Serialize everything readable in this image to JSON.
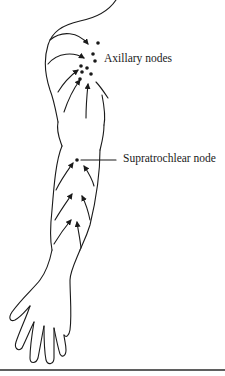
{
  "diagram": {
    "labels": {
      "axillary": "Axillary nodes",
      "supratrochlear": "Supratrochlear node"
    },
    "colors": {
      "line": "#1a1a1a",
      "rule": "#2a2a2a",
      "background": "#ffffff"
    }
  }
}
